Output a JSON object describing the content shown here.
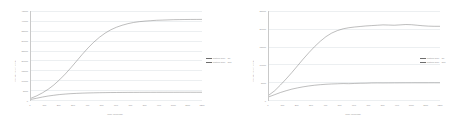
{
  "figure": {
    "panels": [
      "left",
      "right"
    ]
  },
  "chart_data": [
    {
      "type": "line",
      "panel": "left",
      "title": "",
      "xlabel": "Time (seconds)",
      "ylabel": "Concentration (ppm)",
      "grid": true,
      "legend_position": "right",
      "xlim": [
        0,
        1200
      ],
      "ylim": [
        0,
        45000
      ],
      "xticks": [
        0,
        100,
        200,
        300,
        400,
        500,
        600,
        700,
        800,
        900,
        1000,
        1100,
        1200
      ],
      "xticklabels": [
        "0",
        "100",
        "200",
        "300",
        "400",
        "500",
        "600",
        "700",
        "800",
        "900",
        "1000",
        "1100",
        "1200"
      ],
      "yticks": [
        0,
        5000,
        10000,
        15000,
        20000,
        25000,
        30000,
        35000,
        40000,
        45000
      ],
      "yticklabels": [
        "0",
        "5000",
        "10000",
        "15000",
        "20000",
        "25000",
        "30000",
        "35000",
        "40000",
        "45000"
      ],
      "series": [
        {
          "name": "Particle size = 50",
          "color": "#6e6e6e",
          "x": [
            0,
            40,
            80,
            120,
            160,
            200,
            240,
            280,
            320,
            360,
            400,
            440,
            480,
            520,
            560,
            600,
            640,
            680,
            720,
            760,
            800,
            840,
            880,
            920,
            960,
            1000,
            1040,
            1080,
            1120,
            1160,
            1200
          ],
          "values": [
            900,
            2100,
            3600,
            5400,
            7600,
            10200,
            13100,
            16300,
            19700,
            23100,
            26300,
            29200,
            31700,
            33800,
            35500,
            36800,
            37800,
            38600,
            39200,
            39600,
            39900,
            40100,
            40300,
            40400,
            40500,
            40600,
            40650,
            40700,
            40720,
            40740,
            40750
          ]
        },
        {
          "name": "Particle size = 500",
          "color": "#6e6e6e",
          "x": [
            0,
            40,
            80,
            120,
            160,
            200,
            240,
            280,
            320,
            360,
            400,
            440,
            480,
            520,
            560,
            600,
            640,
            680,
            720,
            760,
            800,
            840,
            880,
            920,
            960,
            1000,
            1040,
            1080,
            1120,
            1160,
            1200
          ],
          "values": [
            300,
            900,
            1500,
            2000,
            2400,
            2750,
            3000,
            3200,
            3350,
            3470,
            3560,
            3630,
            3690,
            3730,
            3770,
            3800,
            3820,
            3840,
            3855,
            3865,
            3875,
            3882,
            3888,
            3893,
            3897,
            3900,
            3903,
            3905,
            3907,
            3908,
            3910
          ]
        }
      ]
    },
    {
      "type": "line",
      "panel": "right",
      "title": "",
      "xlabel": "Time (seconds)",
      "ylabel": "Concentration (ppm)",
      "grid": true,
      "legend_position": "right",
      "xlim": [
        0,
        1200
      ],
      "ylim": [
        0,
        25000
      ],
      "xticks": [
        0,
        100,
        200,
        300,
        400,
        500,
        600,
        700,
        800,
        900,
        1000,
        1100,
        1200
      ],
      "xticklabels": [
        "0",
        "100",
        "200",
        "300",
        "400",
        "500",
        "600",
        "700",
        "800",
        "900",
        "1000",
        "1100",
        "1200"
      ],
      "yticks": [
        0,
        5000,
        10000,
        15000,
        20000,
        25000
      ],
      "yticklabels": [
        "0",
        "5000",
        "10000",
        "15000",
        "20000",
        "25000"
      ],
      "series": [
        {
          "name": "Particle size = 50",
          "color": "#6e6e6e",
          "x": [
            0,
            40,
            80,
            120,
            160,
            200,
            240,
            280,
            320,
            360,
            400,
            440,
            480,
            520,
            560,
            600,
            640,
            680,
            720,
            760,
            800,
            840,
            880,
            920,
            960,
            1000,
            1040,
            1080,
            1120,
            1160,
            1200
          ],
          "values": [
            1400,
            2600,
            4200,
            5900,
            7700,
            9600,
            11500,
            13300,
            15000,
            16500,
            17800,
            18800,
            19500,
            20000,
            20300,
            20500,
            20650,
            20800,
            20900,
            21000,
            21100,
            21050,
            21000,
            21100,
            21200,
            21150,
            21000,
            20850,
            20750,
            20700,
            20700
          ]
        },
        {
          "name": "Particle size = 500",
          "color": "#6e6e6e",
          "x": [
            0,
            40,
            80,
            120,
            160,
            200,
            240,
            280,
            320,
            360,
            400,
            440,
            480,
            520,
            560,
            600,
            640,
            680,
            720,
            760,
            800,
            840,
            880,
            920,
            960,
            1000,
            1040,
            1080,
            1120,
            1160,
            1200
          ],
          "values": [
            900,
            1500,
            2100,
            2600,
            3050,
            3400,
            3700,
            3950,
            4150,
            4300,
            4420,
            4500,
            4560,
            4620,
            4580,
            4650,
            4700,
            4720,
            4780,
            4800,
            4790,
            4800,
            4810,
            4815,
            4820,
            4825,
            4828,
            4830,
            4832,
            4834,
            4835
          ]
        }
      ]
    }
  ]
}
